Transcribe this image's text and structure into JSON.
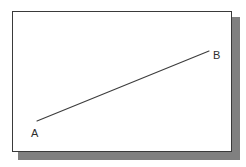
{
  "figure": {
    "frame": {
      "name": "drawing-frame",
      "background_color": "#ffffff",
      "border_color": "#3a3a3a",
      "shadow_color": "#808080"
    },
    "line": {
      "name": "segment-ab",
      "color": "#3c3c3c",
      "stroke_width": 1.1,
      "start": {
        "x": 37,
        "y": 121
      },
      "end": {
        "x": 209,
        "y": 51
      }
    },
    "labels": [
      {
        "id": "A",
        "text": "A",
        "x": 31,
        "y": 128
      },
      {
        "id": "B",
        "text": "B",
        "x": 213,
        "y": 50
      }
    ]
  },
  "chart_data": {
    "type": "line",
    "subtitle": "",
    "xlabel": "",
    "ylabel": "",
    "grid": false,
    "legend": "none",
    "annotations": [
      "A",
      "B"
    ],
    "series": [
      {
        "name": "AB",
        "points": [
          {
            "label": "A",
            "x": 37,
            "y": 121
          },
          {
            "label": "B",
            "x": 209,
            "y": 51
          }
        ]
      }
    ]
  }
}
